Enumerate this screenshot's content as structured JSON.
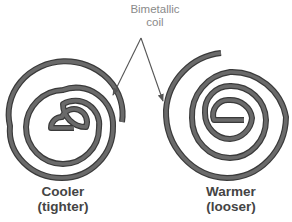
{
  "diagram": {
    "callout": {
      "line1": "Bimetallic",
      "line2": "coil"
    },
    "left_coil": {
      "state": "Cooler",
      "detail": "(tighter)"
    },
    "right_coil": {
      "state": "Warmer",
      "detail": "(looser)"
    },
    "colors": {
      "coil": "#5f5f5f",
      "coil_edge": "#3a3a3a",
      "arrow": "#555555",
      "callout_text": "#8a8a8a",
      "caption_text": "#444444",
      "background": "#ffffff"
    }
  }
}
